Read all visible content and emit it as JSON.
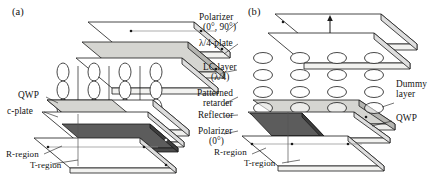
{
  "figure": {
    "type": "device-cross-section-diagram",
    "panels": [
      {
        "id": "a",
        "tag": "(a)",
        "lc_orientation": "vertical-ellipses",
        "grid": {
          "cols": 4,
          "rows": 3
        },
        "layers": [
          {
            "name": "Polarizer",
            "sub": "(0°, 90°)",
            "fill": "white"
          },
          {
            "name": "λ/4-plate",
            "sub": "",
            "fill": "light-gray"
          },
          {
            "name": "substrate",
            "sub": "",
            "fill": "white"
          },
          {
            "name": "LC layer",
            "sub": "(λ/4)",
            "fill": "none"
          },
          {
            "name": "Patterned retarder",
            "sub": "",
            "fill": "half-gray"
          },
          {
            "name": "c-plate",
            "sub": "",
            "fill": "white"
          },
          {
            "name": "Reflector",
            "sub": "",
            "fill": "dark-gray"
          },
          {
            "name": "Polarizer",
            "sub": "(0°)",
            "fill": "white"
          }
        ],
        "left_labels": [
          {
            "text": "QWP"
          },
          {
            "text": "c-plate"
          },
          {
            "text": "R-region"
          },
          {
            "text": "T-region"
          }
        ]
      },
      {
        "id": "b",
        "tag": "(b)",
        "lc_orientation": "horizontal-ellipses",
        "grid": {
          "cols": 4,
          "rows": 4
        },
        "has_double_arrow": true,
        "right_labels": [
          {
            "text": "Dummy"
          },
          {
            "text": "layer"
          },
          {
            "text": "QWP"
          }
        ],
        "bottom_labels": [
          {
            "text": "R-region"
          },
          {
            "text": "T-region"
          }
        ]
      }
    ],
    "center_labels": [
      {
        "name": "polarizer-top",
        "line1": "Polarizer",
        "line2": "(0°, 90°)"
      },
      {
        "name": "quarter-wave-plate",
        "line1": "λ/4-plate",
        "line2": ""
      },
      {
        "name": "lc-layer",
        "line1": "LC layer",
        "line2": "(λ/4)"
      },
      {
        "name": "patterned-retarder",
        "line1": "Patterned",
        "line2": "retarder"
      },
      {
        "name": "reflector",
        "line1": "Reflector",
        "line2": ""
      },
      {
        "name": "polarizer-bottom",
        "line1": "Polarizer",
        "line2": "(0°)"
      }
    ],
    "colors": {
      "stroke": "#1a1a1a",
      "plate_white": "#ffffff",
      "plate_light": "#d8d8d4",
      "plate_mid": "#b9b9b5",
      "plate_dark": "#5c5c5c",
      "edge_gray": "#9a9a96"
    }
  }
}
